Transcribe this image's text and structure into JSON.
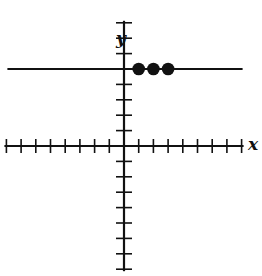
{
  "chart_data": {
    "type": "scatter",
    "title": "",
    "xlabel": "x",
    "ylabel": "y",
    "xlim": [
      -8,
      8
    ],
    "ylim": [
      -8,
      8
    ],
    "grid": false,
    "tick_labels": false,
    "series": [
      {
        "name": "horizontal line",
        "kind": "line",
        "equation": "y = 5",
        "points": [
          [
            -8,
            5
          ],
          [
            8,
            5
          ]
        ]
      },
      {
        "name": "points",
        "kind": "scatter",
        "points": [
          [
            1,
            5
          ],
          [
            2,
            5
          ],
          [
            3,
            5
          ]
        ]
      }
    ]
  },
  "labels": {
    "x_axis": "x",
    "y_axis": "y"
  },
  "colors": {
    "ink": "#111111",
    "background": "#ffffff"
  }
}
